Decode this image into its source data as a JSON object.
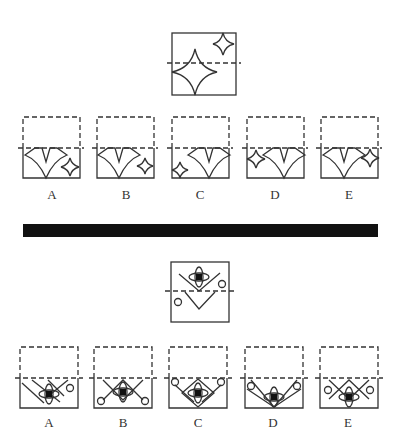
{
  "puzzles": [
    {
      "id": "star-folding",
      "question": {
        "description": "Square with dashed fold line; large four-point star lower-left crossing fold, small four-point star upper-right"
      },
      "options": [
        {
          "label": "A",
          "description": "V-shapes with small star at bottom-right"
        },
        {
          "label": "B",
          "description": "V-shapes with small star at right, mid height"
        },
        {
          "label": "C",
          "description": "Small star at left-bottom, V-shapes right"
        },
        {
          "label": "D",
          "description": "Small star at left on fold line, V-shapes right"
        },
        {
          "label": "E",
          "description": "V-shapes left, small star at right on fold line"
        }
      ]
    },
    {
      "id": "ellipse-folding",
      "question": {
        "description": "Square with dashed fold line; crossed ellipses with black square at top, two V lines, two small circles"
      },
      "options": [
        {
          "label": "A"
        },
        {
          "label": "B"
        },
        {
          "label": "C"
        },
        {
          "label": "D"
        },
        {
          "label": "E"
        }
      ]
    }
  ],
  "colors": {
    "ink": "#333333",
    "divider": "#111111",
    "background": "#ffffff"
  }
}
